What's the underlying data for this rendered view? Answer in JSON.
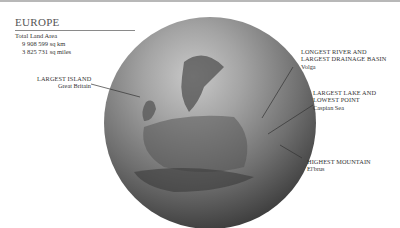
{
  "title": "EUROPE",
  "land_area": {
    "label": "Total Land Area",
    "km": "9 908 599 sq km",
    "miles": "3 825 731 sq miles"
  },
  "callouts": [
    {
      "heading": "LARGEST ISLAND",
      "value": "Great Britain"
    },
    {
      "heading_line1": "LONGEST RIVER AND",
      "heading_line2": "LARGEST DRAINAGE BASIN",
      "value": "Volga"
    },
    {
      "heading_line1": "LARGEST LAKE AND",
      "heading_line2": "LOWEST POINT",
      "value": "Caspian Sea"
    },
    {
      "heading": "HIGHEST MOUNTAIN",
      "value": "El'brus"
    }
  ],
  "colors": {
    "background": "#ffffff",
    "globe_dark": "#1f1f1f",
    "globe_light": "#c9c9c9",
    "text": "#333333"
  }
}
